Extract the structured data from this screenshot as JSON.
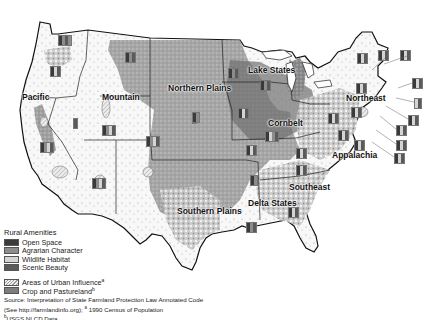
{
  "map": {
    "type": "choropleth-with-symbols",
    "subject": "Rural amenities and farmland protection across US farm resource regions",
    "regions": [
      {
        "name": "Pacific",
        "x": 22,
        "y": 92
      },
      {
        "name": "Mountain",
        "x": 102,
        "y": 92
      },
      {
        "name": "Northern Plains",
        "x": 168,
        "y": 83
      },
      {
        "name": "Lake States",
        "x": 248,
        "y": 65
      },
      {
        "name": "Cornbelt",
        "x": 268,
        "y": 118
      },
      {
        "name": "Northeast",
        "x": 346,
        "y": 93
      },
      {
        "name": "Appalachia",
        "x": 332,
        "y": 150
      },
      {
        "name": "Southeast",
        "x": 289,
        "y": 182
      },
      {
        "name": "Delta States",
        "x": 248,
        "y": 198
      },
      {
        "name": "Southern Plains",
        "x": 177,
        "y": 206
      }
    ],
    "colors": {
      "open_space": "#3a3a3a",
      "agrarian_character": "#8c8c8c",
      "wildlife_habitat": "#d4d4d4",
      "scenic_beauty": "#5a5a5a",
      "urban_influence": "#e6e6e6",
      "crop_pasture": "#7d7d7d",
      "boundary": "#111111"
    }
  },
  "legend": {
    "title": "Rural Amenities",
    "items": [
      {
        "label": "Open Space",
        "color": "#3a3a3a",
        "pattern": "solid"
      },
      {
        "label": "Agrarian Character",
        "color": "#8c8c8c",
        "pattern": "solid"
      },
      {
        "label": "Wildlife Habitat",
        "color": "#d4d4d4",
        "pattern": "solid"
      },
      {
        "label": "Scenic Beauty",
        "color": "#5a5a5a",
        "pattern": "solid"
      }
    ],
    "overlays": [
      {
        "label": "Areas of Urban Influence",
        "superscript": "a",
        "pattern": "hatched"
      },
      {
        "label": "Crop and Pastureland",
        "superscript": "b",
        "pattern": "solid"
      }
    ]
  },
  "source": {
    "line1": "Source: Interpretation of State Farmland Protection Law Annotated Code",
    "line2": "(See http://farmlandinfo.org); ",
    "line2_sup": "a",
    "line2_rest": " 1990 Census of Population",
    "line3_sup": "b",
    "line3": "USGS NLCD Data."
  }
}
